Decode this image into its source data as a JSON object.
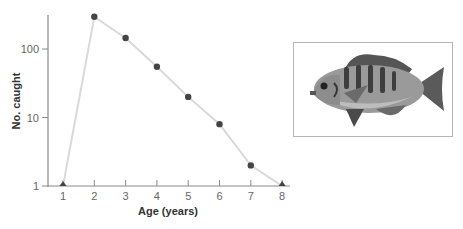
{
  "chart_data": {
    "type": "line",
    "title": "",
    "xlabel": "Age (years)",
    "ylabel": "No. caught",
    "yscale": "log",
    "ylim": [
      1,
      300
    ],
    "x": [
      1,
      2,
      3,
      4,
      5,
      6,
      7,
      8
    ],
    "x_tick_labels": [
      "1",
      "2",
      "3",
      "4",
      "5",
      "6",
      "7",
      "8"
    ],
    "y_tick_labels": [
      "1",
      "10",
      "100"
    ],
    "y_ticks": [
      1,
      10,
      100
    ],
    "series": [
      {
        "name": "No. caught",
        "values": [
          1,
          295,
          145,
          55,
          20,
          8,
          2,
          1
        ],
        "markers": [
          "triangle",
          "circle",
          "circle",
          "circle",
          "circle",
          "circle",
          "circle",
          "triangle"
        ]
      }
    ],
    "grid": false,
    "legend": "none",
    "line_color": "#d9d9d9",
    "marker_color": "#444444",
    "annotation_image": "bluegill-sunfish-illustration"
  }
}
